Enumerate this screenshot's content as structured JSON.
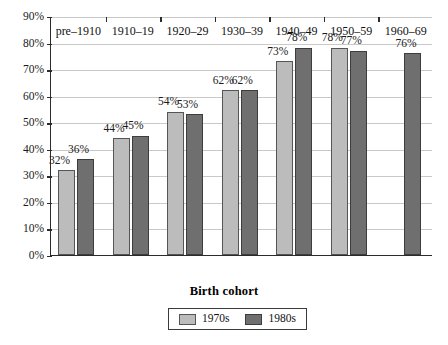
{
  "chart_data": {
    "type": "bar",
    "title": "",
    "xlabel": "Birth cohort",
    "ylabel": "",
    "categories": [
      "pre–1910",
      "1910–19",
      "1920–29",
      "1930–39",
      "1940–49",
      "1950–59",
      "1960–69"
    ],
    "series": [
      {
        "name": "1970s",
        "color": "#bcbcbc",
        "values": [
          32,
          44,
          54,
          62,
          73,
          78,
          null
        ],
        "labels": [
          "32%",
          "44%",
          "54%",
          "62%",
          "73%",
          "78%",
          ""
        ]
      },
      {
        "name": "1980s",
        "color": "#6f6f6f",
        "values": [
          36,
          45,
          53,
          62,
          78,
          77,
          76
        ],
        "labels": [
          "36%",
          "45%",
          "53%",
          "62%",
          "78%",
          "77%",
          "76%"
        ]
      }
    ],
    "ylim": [
      0,
      90
    ],
    "ytick_values": [
      0,
      10,
      20,
      30,
      40,
      50,
      60,
      70,
      80,
      90
    ],
    "ytick_labels": [
      "0%",
      "10%",
      "20%",
      "30%",
      "40%",
      "50%",
      "60%",
      "70%",
      "80%",
      "90%"
    ],
    "grid": true,
    "legend_position": "bottom",
    "value_suffix": "%"
  },
  "legend": {
    "items": [
      {
        "label": "1970s"
      },
      {
        "label": "1980s"
      }
    ]
  }
}
